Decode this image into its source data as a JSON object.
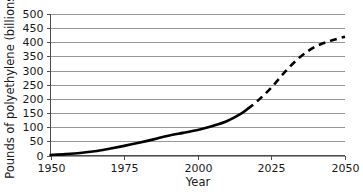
{
  "chart_data": {
    "type": "line",
    "title": "",
    "subtitle": "",
    "xlabel": "Year",
    "ylabel": "Pounds of polyethylene (billions)",
    "xlim": [
      1950,
      2050
    ],
    "ylim": [
      0,
      500
    ],
    "grid": true,
    "grid_axis": "y",
    "legend": "none",
    "x_ticks": [
      1950,
      1975,
      2000,
      2025,
      2050
    ],
    "x_tick_labels": [
      "1950",
      "1975",
      "2000",
      "2025",
      "2050"
    ],
    "y_ticks": [
      0,
      50,
      100,
      150,
      200,
      250,
      300,
      350,
      400,
      450,
      500
    ],
    "y_tick_labels": [
      "0",
      "50",
      "100",
      "150",
      "200",
      "250",
      "300",
      "350",
      "400",
      "450",
      "500"
    ],
    "series": [
      {
        "name": "Historical polyethylene production",
        "style": "solid",
        "color": "#000000",
        "x": [
          1950,
          1955,
          1960,
          1965,
          1970,
          1975,
          1980,
          1985,
          1990,
          1995,
          2000,
          2005,
          2010,
          2015,
          2017
        ],
        "values": [
          2,
          5,
          9,
          15,
          24,
          34,
          45,
          57,
          70,
          80,
          90,
          104,
          122,
          150,
          165
        ]
      },
      {
        "name": "Projected polyethylene production",
        "style": "dashed",
        "color": "#000000",
        "x": [
          2017,
          2020,
          2025,
          2030,
          2035,
          2040,
          2045,
          2050
        ],
        "values": [
          165,
          190,
          240,
          300,
          350,
          385,
          405,
          420
        ]
      }
    ],
    "annotations": []
  },
  "axis_titles": {
    "x": "Year",
    "y": "Pounds of polyethylene (billions)"
  },
  "colors": {
    "series": "#000000",
    "gridline": "#8c8c8c",
    "axis": "#4d4d4d",
    "background": "#ffffff",
    "text": "#1a1a1a"
  }
}
